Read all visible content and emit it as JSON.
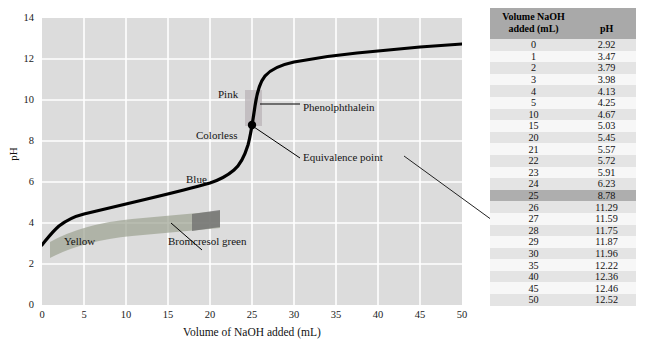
{
  "chart_data": {
    "type": "line",
    "title": "",
    "xlabel": "Volume of NaOH added (mL)",
    "ylabel": "pH",
    "xlim": [
      0,
      50
    ],
    "ylim": [
      0,
      14
    ],
    "xticks": [
      0,
      5,
      10,
      15,
      20,
      25,
      30,
      35,
      40,
      45,
      50
    ],
    "yticks": [
      0,
      2,
      4,
      6,
      8,
      10,
      12,
      14
    ],
    "grid": true,
    "legend": "none",
    "x": [
      0,
      1,
      2,
      3,
      4,
      5,
      10,
      15,
      20,
      21,
      22,
      23,
      24,
      25,
      26,
      27,
      28,
      29,
      30,
      35,
      40,
      45,
      50
    ],
    "y": [
      2.92,
      3.47,
      3.79,
      3.98,
      4.13,
      4.25,
      4.67,
      5.03,
      5.45,
      5.57,
      5.72,
      5.91,
      6.23,
      8.78,
      11.29,
      11.59,
      11.75,
      11.87,
      11.96,
      12.22,
      12.36,
      12.46,
      12.52
    ],
    "equivalence_point": {
      "x": 25,
      "y": 8.78
    },
    "indicator_bands": [
      {
        "name": "Bromcresol green",
        "x_start": 0,
        "x_end": 21,
        "ph_low": 3.8,
        "ph_high": 5.4,
        "color": "#9aa08f"
      },
      {
        "name": "Phenolphthalein",
        "x_start": 24.3,
        "x_end": 25.6,
        "ph_low": 8.3,
        "ph_high": 10.0,
        "color": "#c9c0c4"
      }
    ],
    "annotations": [
      {
        "name": "pink-label",
        "text": "Pink"
      },
      {
        "name": "colorless-label",
        "text": "Colorless"
      },
      {
        "name": "blue-label",
        "text": "Blue"
      },
      {
        "name": "yellow-label",
        "text": "Yellow"
      },
      {
        "name": "phenolphthalein-label",
        "text": "Phenolphthalein"
      },
      {
        "name": "equivalence-point-label",
        "text": "Equivalence point"
      },
      {
        "name": "bromcresol-green-label",
        "text": "Bromcresol green"
      }
    ]
  },
  "chart": {
    "yticks": [
      "14",
      "12",
      "10",
      "8",
      "6",
      "4",
      "2",
      "0"
    ],
    "xticks": [
      "0",
      "5",
      "10",
      "15",
      "20",
      "25",
      "30",
      "35",
      "40",
      "45",
      "50"
    ],
    "xlabel": "Volume of NaOH added (mL)",
    "ylabel": "pH",
    "annotations": {
      "pink": "Pink",
      "colorless": "Colorless",
      "blue": "Blue",
      "yellow": "Yellow",
      "phenolphthalein": "Phenolphthalein",
      "equivalence_point": "Equivalence point",
      "bromcresol_green": "Bromcresol green"
    }
  },
  "table": {
    "headers": {
      "volume": "Volume NaOH\nadded (mL)",
      "volume_line1": "Volume NaOH",
      "volume_line2": "added (mL)",
      "ph": "pH"
    },
    "highlighted_volume": "25",
    "rows": [
      {
        "volume": "0",
        "ph": "2.92"
      },
      {
        "volume": "1",
        "ph": "3.47"
      },
      {
        "volume": "2",
        "ph": "3.79"
      },
      {
        "volume": "3",
        "ph": "3.98"
      },
      {
        "volume": "4",
        "ph": "4.13"
      },
      {
        "volume": "5",
        "ph": "4.25"
      },
      {
        "volume": "10",
        "ph": "4.67"
      },
      {
        "volume": "15",
        "ph": "5.03"
      },
      {
        "volume": "20",
        "ph": "5.45"
      },
      {
        "volume": "21",
        "ph": "5.57"
      },
      {
        "volume": "22",
        "ph": "5.72"
      },
      {
        "volume": "23",
        "ph": "5.91"
      },
      {
        "volume": "24",
        "ph": "6.23"
      },
      {
        "volume": "25",
        "ph": "8.78"
      },
      {
        "volume": "26",
        "ph": "11.29"
      },
      {
        "volume": "27",
        "ph": "11.59"
      },
      {
        "volume": "28",
        "ph": "11.75"
      },
      {
        "volume": "29",
        "ph": "11.87"
      },
      {
        "volume": "30",
        "ph": "11.96"
      },
      {
        "volume": "35",
        "ph": "12.22"
      },
      {
        "volume": "40",
        "ph": "12.36"
      },
      {
        "volume": "45",
        "ph": "12.46"
      },
      {
        "volume": "50",
        "ph": "12.52"
      }
    ]
  },
  "colors": {
    "plot_background": "#dcdcdc",
    "gridline": "#ffffff",
    "curve": "#000000",
    "table_header_bg": "#a9a9a9",
    "table_highlight_bg": "#aeaeae",
    "bromcresol_band": "#9aa08f",
    "phenolphthalein_band": "#c9c0c4"
  }
}
